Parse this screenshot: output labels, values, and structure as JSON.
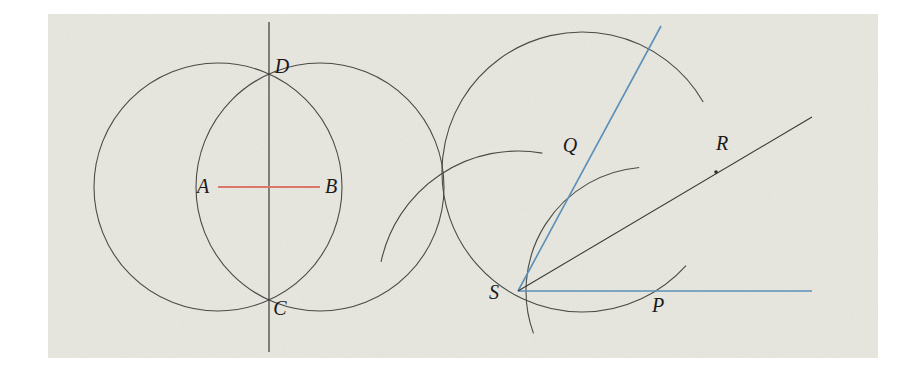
{
  "figure": {
    "background_color": "#e8e7df",
    "panel_rect": {
      "x": 48,
      "y": 14,
      "width": 830,
      "height": 344
    },
    "ink_color": "#3a3a38",
    "accent_red": "#d9776b",
    "accent_blue": "#5b8fb8",
    "panels": [
      {
        "name": "perpendicular-bisector-construction",
        "description": "Two equal circles centered at A and B intersecting at D and C; segment AB drawn in red; line DC is the perpendicular bisector.",
        "labels": [
          {
            "id": "A",
            "text": "A",
            "x": 203,
            "y": 193
          },
          {
            "id": "B",
            "text": "B",
            "x": 331,
            "y": 193
          },
          {
            "id": "C",
            "text": "C",
            "x": 280,
            "y": 315
          },
          {
            "id": "D",
            "text": "D",
            "x": 282,
            "y": 73
          }
        ],
        "circles": [
          {
            "id": "circle-A",
            "cx": 218,
            "cy": 187,
            "r": 124
          },
          {
            "id": "circle-B",
            "cx": 320,
            "cy": 187,
            "r": 124
          }
        ],
        "segments": [
          {
            "id": "segment-AB",
            "x1": 218,
            "y1": 187,
            "x2": 320,
            "y2": 187,
            "color": "#d9776b"
          },
          {
            "id": "line-DC",
            "x1": 269,
            "y1": 22,
            "x2": 269,
            "y2": 352,
            "color": "#3a3a38"
          }
        ],
        "points": [
          {
            "id": "point-A",
            "x": 218,
            "y": 187
          },
          {
            "id": "point-B",
            "x": 320,
            "y": 187
          },
          {
            "id": "point-D",
            "x": 269,
            "y": 87
          },
          {
            "id": "point-C",
            "x": 269,
            "y": 284
          }
        ]
      },
      {
        "name": "angle-bisector-construction",
        "description": "Angle with vertex S; arc centered at S meets the rays at P and Q; arcs centered at P and Q meet at R; ray SR bisects the angle.",
        "labels": [
          {
            "id": "S",
            "text": "S",
            "x": 494,
            "y": 299
          },
          {
            "id": "P",
            "text": "P",
            "x": 658,
            "y": 312
          },
          {
            "id": "Q",
            "text": "Q",
            "x": 570,
            "y": 152
          },
          {
            "id": "R",
            "text": "R",
            "x": 722,
            "y": 150
          }
        ],
        "rays": [
          {
            "id": "ray-S-horizontal",
            "x1": 518,
            "y1": 291,
            "x2": 812,
            "y2": 291,
            "color": "#5b8fb8"
          },
          {
            "id": "ray-S-upper",
            "x1": 518,
            "y1": 291,
            "x2": 661,
            "y2": 26,
            "color": "#5b8fb8"
          },
          {
            "id": "ray-bisector-SR",
            "x1": 518,
            "y1": 291,
            "x2": 812,
            "y2": 117,
            "color": "#3a3a38"
          }
        ],
        "arcs": [
          {
            "id": "arc-center-S",
            "cx": 518,
            "cy": 291,
            "r": 140,
            "start_deg": 168,
            "end_deg": 80
          },
          {
            "id": "arc-center-P",
            "cx": 650,
            "cy": 291,
            "r": 124,
            "start_deg": 200,
            "end_deg": 95
          },
          {
            "id": "arc-center-Q",
            "cx": 582,
            "cy": 172,
            "r": 140,
            "start_deg": 318,
            "end_deg": 30
          }
        ],
        "points": [
          {
            "id": "point-S",
            "x": 518,
            "y": 291
          },
          {
            "id": "point-P",
            "x": 650,
            "y": 291
          },
          {
            "id": "point-Q",
            "x": 582,
            "y": 172
          },
          {
            "id": "point-R",
            "x": 716,
            "y": 172
          }
        ]
      }
    ]
  }
}
